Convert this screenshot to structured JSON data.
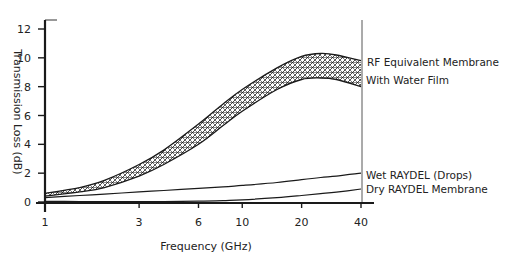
{
  "chart_data": {
    "type": "line",
    "title": "",
    "xlabel": "Frequency (GHz)",
    "ylabel": "Transmission Loss (dB)",
    "xscale": "log",
    "xlim": [
      1,
      40
    ],
    "ylim": [
      0,
      12
    ],
    "x_ticks": [
      1,
      3,
      6,
      10,
      20,
      40
    ],
    "x_tick_labels": [
      "1",
      "3",
      "6",
      "10",
      "20",
      "40"
    ],
    "y_ticks": [
      0,
      2,
      4,
      6,
      8,
      10,
      12
    ],
    "y_tick_labels": [
      "0",
      "2",
      "4",
      "6",
      "8",
      "10",
      "12"
    ],
    "grid": false,
    "legend_position": "inline-right",
    "x": [
      1,
      1.5,
      2,
      3,
      4,
      6,
      8,
      10,
      15,
      20,
      25,
      30,
      40
    ],
    "series": [
      {
        "name": "RF Equivalent Membrane With Water Film (upper bound)",
        "style": "hatched-band-upper",
        "values": [
          0.6,
          1.0,
          1.5,
          2.6,
          3.6,
          5.4,
          6.8,
          7.8,
          9.3,
          10.1,
          10.3,
          10.2,
          9.8
        ]
      },
      {
        "name": "RF Equivalent Membrane With Water Film (lower bound)",
        "style": "hatched-band-lower",
        "values": [
          0.4,
          0.7,
          1.0,
          1.8,
          2.6,
          4.0,
          5.3,
          6.3,
          7.8,
          8.5,
          8.6,
          8.5,
          8.0
        ]
      },
      {
        "name": "Wet RAYDEL (Drops)",
        "style": "line",
        "values": [
          0.3,
          0.45,
          0.55,
          0.7,
          0.8,
          0.95,
          1.05,
          1.15,
          1.35,
          1.55,
          1.7,
          1.8,
          2.0
        ]
      },
      {
        "name": "Dry RAYDEL Membrane",
        "style": "line",
        "values": [
          0.05,
          0.03,
          0.02,
          0.02,
          0.03,
          0.06,
          0.1,
          0.15,
          0.3,
          0.45,
          0.58,
          0.68,
          0.9
        ]
      }
    ],
    "annotations": [
      {
        "text": "RF Equivalent Membrane",
        "at_series": 0
      },
      {
        "text": "With Water Film",
        "at_series": 1
      },
      {
        "text": "Wet RAYDEL (Drops)",
        "at_series": 2
      },
      {
        "text": "Dry RAYDEL Membrane",
        "at_series": 3
      }
    ]
  },
  "labels": {
    "band_line1": "RF Equivalent Membrane",
    "band_line2": "With Water Film",
    "wet": "Wet RAYDEL (Drops)",
    "dry": "Dry RAYDEL Membrane",
    "xlabel": "Frequency (GHz)",
    "ylabel": "Transmission Loss (dB)"
  },
  "colors": {
    "ink": "#1a1a1a",
    "background": "#ffffff"
  }
}
